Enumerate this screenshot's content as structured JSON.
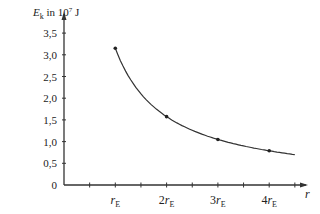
{
  "chart_data": {
    "type": "line",
    "title": "",
    "ylabel": "E_k in 10^7 J",
    "ylabel_parts": {
      "symbol": "E",
      "sub": "k",
      "text": " in 10",
      "sup": "7",
      "unit": " J"
    },
    "xlabel": "r",
    "ylim": [
      0,
      3.5
    ],
    "yticks": [
      "0",
      "0,5",
      "1,0",
      "1,5",
      "2,0",
      "2,5",
      "3,0",
      "3,5"
    ],
    "xtick_labels": [
      {
        "coef": "",
        "sym": "r",
        "sub": "E",
        "x": 1
      },
      {
        "coef": "2",
        "sym": "r",
        "sub": "E",
        "x": 2
      },
      {
        "coef": "3",
        "sym": "r",
        "sub": "E",
        "x": 3
      },
      {
        "coef": "4",
        "sym": "r",
        "sub": "E",
        "x": 4
      }
    ],
    "x_minor_ticks": [
      0.5,
      1,
      1.5,
      2,
      2.5,
      3,
      3.5,
      4,
      4.5
    ],
    "points": [
      {
        "x": 1,
        "y": 3.15
      },
      {
        "x": 2,
        "y": 1.575
      },
      {
        "x": 3,
        "y": 1.05
      },
      {
        "x": 4,
        "y": 0.79
      }
    ],
    "curve": "E_k proportional to 1/r, from r = rE to r ≈ 4.5 rE",
    "grid": false,
    "legend": null
  }
}
